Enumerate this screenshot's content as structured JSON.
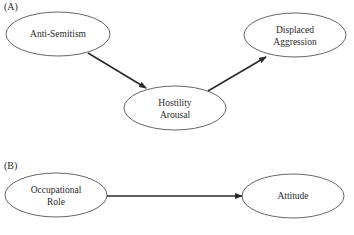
{
  "panels": [
    {
      "label": "(A)",
      "nodes": [
        {
          "id": "anti_semitism",
          "lines": [
            "Anti-Semitism"
          ],
          "cx": 58,
          "cy": 34
        },
        {
          "id": "hostility_arousal",
          "lines": [
            "Hostility",
            "Arousal"
          ],
          "cx": 175,
          "cy": 108
        },
        {
          "id": "displaced_aggression",
          "lines": [
            "Displaced",
            "Aggression"
          ],
          "cx": 295,
          "cy": 35
        }
      ],
      "edges": [
        {
          "from": "anti_semitism",
          "to": "hostility_arousal"
        },
        {
          "from": "hostility_arousal",
          "to": "displaced_aggression"
        }
      ]
    },
    {
      "label": "(B)",
      "nodes": [
        {
          "id": "occupational_role",
          "lines": [
            "Occupational",
            "Role"
          ],
          "cx": 56,
          "cy": 195
        },
        {
          "id": "attitude",
          "lines": [
            "Attitude"
          ],
          "cx": 293,
          "cy": 196
        }
      ],
      "edges": [
        {
          "from": "occupational_role",
          "to": "attitude"
        }
      ]
    }
  ],
  "text": {
    "panel_a": "(A)",
    "panel_b": "(B)",
    "anti_semitism": "Anti-Semitism",
    "hostility_1": "Hostility",
    "hostility_2": "Arousal",
    "displaced_1": "Displaced",
    "displaced_2": "Aggression",
    "occupational_1": "Occupational",
    "occupational_2": "Role",
    "attitude": "Attitude"
  },
  "colors": {
    "stroke": "#2a2a2a",
    "background": "#ffffff"
  }
}
